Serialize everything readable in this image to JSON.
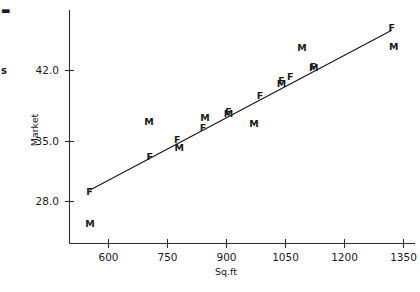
{
  "chart_data": {
    "type": "scatter",
    "title": "",
    "xlabel": "Sq.ft",
    "ylabel": "Market",
    "xlim": [
      520,
      1410
    ],
    "ylim": [
      24.2,
      47.6
    ],
    "grid": false,
    "legend": "none",
    "xticks": [
      600,
      750,
      900,
      1050,
      1200,
      1350
    ],
    "xtick_labels": [
      "600",
      "750",
      "900",
      "1050",
      "1200",
      "1350"
    ],
    "yticks": [
      28.0,
      35.0,
      42.0
    ],
    "ytick_labels": [
      "28.0",
      "35.0",
      "42.0"
    ],
    "point_labels": [
      "F",
      "M"
    ],
    "series": [
      {
        "name": "F",
        "marker_text": "F",
        "points": [
          {
            "x": 552,
            "y": 29.1,
            "label": "F"
          },
          {
            "x": 705,
            "y": 32.8,
            "label": "F"
          },
          {
            "x": 775,
            "y": 34.6,
            "label": "F"
          },
          {
            "x": 840,
            "y": 35.9,
            "label": "F"
          },
          {
            "x": 905,
            "y": 37.6,
            "label": "F"
          },
          {
            "x": 985,
            "y": 39.3,
            "label": "F"
          },
          {
            "x": 1040,
            "y": 40.9,
            "label": "F"
          },
          {
            "x": 1062,
            "y": 41.4,
            "label": "F"
          },
          {
            "x": 1120,
            "y": 42.4,
            "label": "F"
          },
          {
            "x": 1320,
            "y": 46.6,
            "label": "F"
          }
        ]
      },
      {
        "name": "M",
        "marker_text": "M",
        "points": [
          {
            "x": 553,
            "y": 25.6,
            "label": "M"
          },
          {
            "x": 703,
            "y": 36.5,
            "label": "M"
          },
          {
            "x": 780,
            "y": 33.8,
            "label": "M"
          },
          {
            "x": 845,
            "y": 37.0,
            "label": "M"
          },
          {
            "x": 905,
            "y": 37.4,
            "label": "M"
          },
          {
            "x": 970,
            "y": 36.3,
            "label": "M"
          },
          {
            "x": 1040,
            "y": 40.6,
            "label": "M"
          },
          {
            "x": 1092,
            "y": 44.4,
            "label": "M"
          },
          {
            "x": 1122,
            "y": 42.3,
            "label": "M"
          },
          {
            "x": 1325,
            "y": 44.6,
            "label": "M"
          }
        ]
      }
    ],
    "fit_line": {
      "name": "regression-line",
      "x_start": 552,
      "y_start": 29.2,
      "x_end": 1320,
      "y_end": 46.3
    },
    "clipped_fragments": [
      "▬",
      "s"
    ]
  }
}
